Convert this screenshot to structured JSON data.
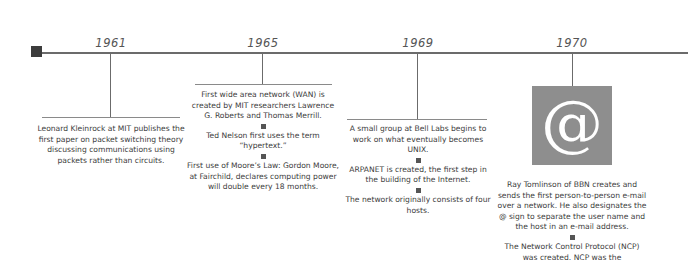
{
  "timeline": {
    "events": [
      {
        "year": "1961",
        "items": [
          "Leonard Kleinrock at MIT publishes the first paper on packet switching theory discussing communications using packets rather than circuits."
        ]
      },
      {
        "year": "1965",
        "items": [
          "First wide area network (WAN) is created by MIT researchers Lawrence G. Roberts and Thomas Merrill.",
          "Ted Nelson first uses the term “hypertext.”",
          "First use of Moore’s Law: Gordon Moore, at Fairchild, declares computing power will double every 18 months."
        ]
      },
      {
        "year": "1969",
        "items": [
          "A small group at Bell Labs begins to work on what eventually becomes UNIX.",
          "ARPANET is created, the first step in the building of the Internet.",
          "The network originally consists of four hosts."
        ]
      },
      {
        "year": "1970",
        "icon": "@",
        "items": [
          "Ray Tomlinson of BBN creates and sends the first person-to-person e-mail over a network. He also designates the @ sign to separate the user name and the host in an e-mail address.",
          "The Network Control Protocol (NCP) was created. NCP was the"
        ]
      }
    ]
  },
  "colors": {
    "line": "#6b6b6b",
    "marker": "#3c3c3c",
    "icon_box": "#8e8e8e",
    "text": "#3c3c3c"
  }
}
